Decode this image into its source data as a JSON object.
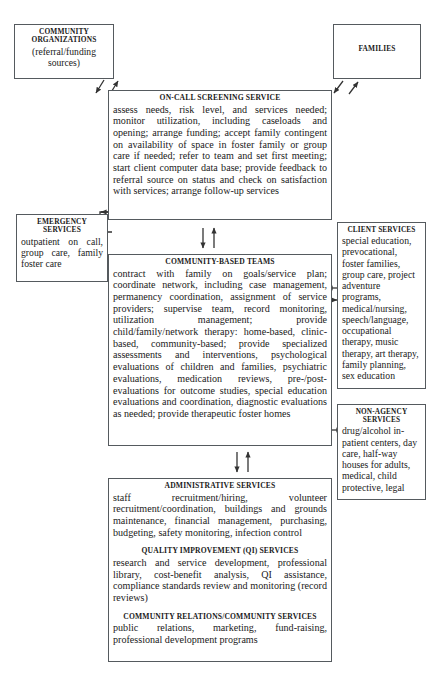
{
  "diagram": {
    "background": "#ffffff",
    "border_color": "#555a5e"
  },
  "boxes": {
    "community_organizations": {
      "heading": "COMMUNITY ORGANIZATIONS",
      "body": "(referral/funding sources)"
    },
    "families": {
      "heading": "FAMILIES",
      "body": ""
    },
    "on_call_screening": {
      "heading": "ON-CALL SCREENING SERVICE",
      "body": "assess needs, risk level, and services needed; monitor utilization, including caseloads and opening; arrange funding; accept family contingent on availability of space in foster family or group care if needed; refer to team and set first meeting; start client computer data base; provide feedback to referral source on status and check on satisfaction with services; arrange follow-up services"
    },
    "emergency_services": {
      "heading": "EMERGENCY SERVICES",
      "body": "outpatient on call, group care, family foster care"
    },
    "community_based_teams": {
      "heading": "COMMUNITY-BASED TEAMS",
      "body": "contract with family on goals/service plan; coordinate network, including case management, permanency coordination, assignment of service providers; supervise team, record monitoring, utilization management; provide child/family/network therapy: home-based, clinic-based, community-based; provide specialized assessments and interventions, psychological evaluations of children and families, psychiatric evaluations, medication reviews, pre-/post-evaluations for outcome studies, special education evaluations and coordination, diagnostic evaluations as needed; provide therapeutic foster homes"
    },
    "client_services": {
      "heading": "CLIENT SERVICES",
      "body": "special education, prevocational, foster families, group care, project adventure programs, medical/nursing, speech/language, occupational therapy, music therapy, art therapy, family planning, sex education"
    },
    "non_agency_services": {
      "heading": "NON-AGENCY SERVICES",
      "body": "drug/alcohol in-patient centers, day care, half-way houses for adults, medical, child protective, legal"
    },
    "administrative": {
      "sections": [
        {
          "heading": "ADMINISTRATIVE SERVICES",
          "body": "staff recruitment/hiring, volunteer recruitment/coordination, buildings and grounds maintenance, financial management, purchasing, budgeting, safety monitoring, infection control"
        },
        {
          "heading": "QUALITY IMPROVEMENT (QI) SERVICES",
          "body": "research and service development, professional library, cost-benefit analysis, QI assistance, compliance standards review and monitoring (record reviews)"
        },
        {
          "heading": "COMMUNITY RELATIONS/COMMUNITY SERVICES",
          "body": "public relations, marketing, fund-raising, professional development programs"
        }
      ]
    }
  },
  "connectors": [
    {
      "name": "community-organizations-to-screening",
      "type": "bidirectional-diagonal"
    },
    {
      "name": "families-to-screening",
      "type": "bidirectional-diagonal"
    },
    {
      "name": "screening-to-teams",
      "type": "bidirectional-vertical"
    },
    {
      "name": "teams-to-administrative",
      "type": "bidirectional-vertical"
    },
    {
      "name": "screening-to-emergency",
      "type": "left-arrow"
    },
    {
      "name": "teams-to-emergency",
      "type": "left-arrow"
    },
    {
      "name": "teams-to-client-services",
      "type": "bidirectional-horizontal"
    },
    {
      "name": "teams-to-non-agency",
      "type": "right-arrow"
    }
  ]
}
